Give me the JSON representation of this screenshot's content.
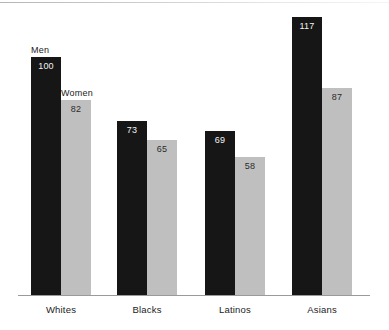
{
  "chart_data": {
    "type": "bar",
    "title": "",
    "subtitle": "",
    "xlabel": "",
    "ylabel": "",
    "grid": false,
    "legend_position": "inline-above-first-group",
    "categories": [
      "Whites",
      "Blacks",
      "Latinos",
      "Asians"
    ],
    "ylim": [
      0,
      125
    ],
    "series": [
      {
        "name": "Men",
        "color": "#161616",
        "values": [
          100,
          73,
          69,
          117
        ],
        "value_labels": [
          "100",
          "73",
          "69",
          "117"
        ]
      },
      {
        "name": "Women",
        "color": "#bfbfbf",
        "values": [
          82,
          65,
          58,
          87
        ],
        "value_labels": [
          "82",
          "65",
          "58",
          "87"
        ]
      }
    ]
  },
  "annotations": {
    "men_label": "Men",
    "women_label": "Women"
  },
  "colors": {
    "men_bar": "#161616",
    "women_bar": "#bfbfbf",
    "axis": "#9a9a9a",
    "background": "#ffffff",
    "dark_text": "#1c1c1c",
    "light_text": "#f2f2f2"
  },
  "geometry": {
    "baseline_y": 295,
    "unit_px_per_value": 2.38,
    "bar_width": 30,
    "group_left_x": [
      31,
      117,
      205,
      292
    ],
    "gap_between_bars": 30
  }
}
